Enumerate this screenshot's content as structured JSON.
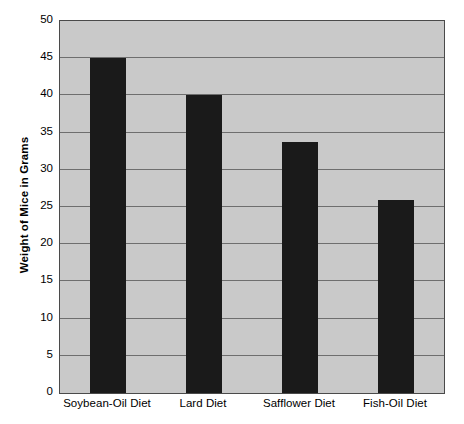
{
  "chart_data": {
    "type": "bar",
    "title": "",
    "xlabel": "",
    "ylabel": "Weight of Mice in Grams",
    "categories": [
      "Soybean-Oil Diet",
      "Lard Diet",
      "Safflower Diet",
      "Fish-Oil Diet"
    ],
    "values": [
      45,
      40,
      33.8,
      26
    ],
    "ylim": [
      0,
      50
    ],
    "ytick_step": 5,
    "yticks": [
      50,
      45,
      40,
      35,
      30,
      25,
      20,
      15,
      10,
      5,
      0
    ],
    "ytick_labels": [
      "50",
      "45",
      "40",
      "35",
      "30",
      "25",
      "20",
      "15",
      "10",
      "5",
      "0"
    ],
    "grid": true,
    "grid_axis": "y",
    "legend": false,
    "legend_position": "none",
    "bar_color": "#1a1a1a",
    "plot_background": "#c9c9c9",
    "gridline_color": "#6e6e6e",
    "axis_color": "#4a4a4a",
    "page_background": "#ffffff",
    "text_color": "#000000"
  }
}
